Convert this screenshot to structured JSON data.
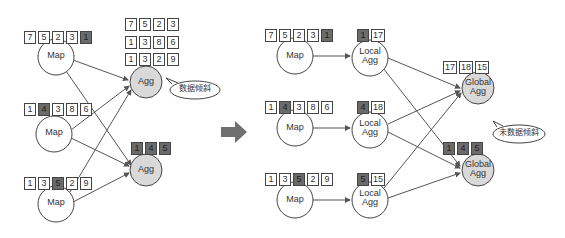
{
  "before": {
    "maps": [
      {
        "label": "Map",
        "values": [
          "7",
          "5",
          "2",
          "3",
          "1"
        ],
        "highlight": [
          4
        ]
      },
      {
        "label": "Map",
        "values": [
          "1",
          "4",
          "3",
          "8",
          "6"
        ],
        "highlight": [
          1
        ]
      },
      {
        "label": "Map",
        "values": [
          "1",
          "3",
          "5",
          "2",
          "9"
        ],
        "highlight": [
          2
        ]
      }
    ],
    "aggs": [
      {
        "label": "Agg",
        "rows": [
          [
            "7",
            "5",
            "2",
            "3"
          ],
          [
            "1",
            "3",
            "8",
            "6"
          ],
          [
            "1",
            "3",
            "2",
            "9"
          ]
        ]
      },
      {
        "label": "Agg",
        "rows": [
          [
            "1",
            "4",
            "5"
          ]
        ],
        "highlight": [
          0,
          1,
          2
        ]
      }
    ],
    "callout": "数据倾斜"
  },
  "after": {
    "maps": [
      {
        "label": "Map",
        "values": [
          "7",
          "5",
          "2",
          "3",
          "1"
        ],
        "highlight": [
          4
        ]
      },
      {
        "label": "Map",
        "values": [
          "1",
          "4",
          "3",
          "8",
          "6"
        ],
        "highlight": [
          1
        ]
      },
      {
        "label": "Map",
        "values": [
          "1",
          "3",
          "5",
          "2",
          "9"
        ],
        "highlight": [
          2
        ]
      }
    ],
    "local_aggs": [
      {
        "label_line1": "Local",
        "label_line2": "Agg",
        "values": [
          "1",
          "17"
        ],
        "highlight": [
          0
        ]
      },
      {
        "label_line1": "Local",
        "label_line2": "Agg",
        "values": [
          "4",
          "18"
        ],
        "highlight": [
          0
        ]
      },
      {
        "label_line1": "Local",
        "label_line2": "Agg",
        "values": [
          "5",
          "15"
        ],
        "highlight": [
          0
        ]
      }
    ],
    "global_aggs": [
      {
        "label_line1": "Global",
        "label_line2": "Agg",
        "values": [
          "17",
          "18",
          "15"
        ]
      },
      {
        "label_line1": "Global",
        "label_line2": "Agg",
        "values": [
          "1",
          "4",
          "5"
        ],
        "highlight": [
          0,
          1,
          2
        ]
      }
    ],
    "callout": "未数据倾斜"
  },
  "colors": {
    "agg_fill": "#d9d9d9",
    "highlight_cell": "#6b6b6b",
    "line": "#555555",
    "transition_arrow": "#6f6f6f"
  }
}
